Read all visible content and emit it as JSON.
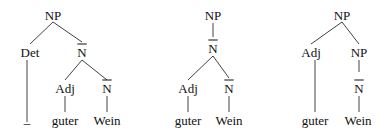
{
  "trees": [
    {
      "nodes": [
        {
          "id": "t1_np",
          "label": "NP",
          "x": 53,
          "y": 15
        },
        {
          "id": "t1_det",
          "label": "Det",
          "x": 30,
          "y": 52
        },
        {
          "id": "t1_nbar1",
          "label": "N",
          "bar": true,
          "x": 82,
          "y": 52
        },
        {
          "id": "t1_adj",
          "label": "Adj",
          "x": 65,
          "y": 88
        },
        {
          "id": "t1_nbar2",
          "label": "N",
          "bar": true,
          "x": 107,
          "y": 88
        },
        {
          "id": "t1_guter",
          "label": "guter",
          "x": 65,
          "y": 120
        },
        {
          "id": "t1_wein",
          "label": "Wein",
          "x": 107,
          "y": 120
        },
        {
          "id": "t1_empty",
          "label": "_",
          "x": 27,
          "y": 118
        }
      ],
      "edges": [
        [
          53,
          22,
          30,
          44
        ],
        [
          53,
          22,
          82,
          42
        ],
        [
          82,
          60,
          65,
          80
        ],
        [
          82,
          60,
          107,
          80
        ],
        [
          27,
          60,
          27,
          122
        ],
        [
          65,
          96,
          65,
          112
        ],
        [
          107,
          96,
          107,
          112
        ]
      ]
    },
    {
      "nodes": [
        {
          "id": "t2_np",
          "label": "NP",
          "x": 213,
          "y": 15
        },
        {
          "id": "t2_nbar1",
          "label": "N",
          "bar": true,
          "x": 213,
          "y": 48
        },
        {
          "id": "t2_adj",
          "label": "Adj",
          "x": 188,
          "y": 88
        },
        {
          "id": "t2_nbar2",
          "label": "N",
          "bar": true,
          "x": 229,
          "y": 88
        },
        {
          "id": "t2_guter",
          "label": "guter",
          "x": 188,
          "y": 120
        },
        {
          "id": "t2_wein",
          "label": "Wein",
          "x": 229,
          "y": 120
        }
      ],
      "edges": [
        [
          213,
          23,
          213,
          37
        ],
        [
          213,
          56,
          188,
          80
        ],
        [
          213,
          56,
          229,
          78
        ],
        [
          188,
          96,
          188,
          112
        ],
        [
          229,
          96,
          229,
          112
        ]
      ]
    },
    {
      "nodes": [
        {
          "id": "t3_np",
          "label": "NP",
          "x": 342,
          "y": 15
        },
        {
          "id": "t3_adj",
          "label": "Adj",
          "x": 311,
          "y": 52
        },
        {
          "id": "t3_np2",
          "label": "NP",
          "x": 359,
          "y": 52
        },
        {
          "id": "t3_nbar",
          "label": "N",
          "bar": true,
          "x": 359,
          "y": 88
        },
        {
          "id": "t3_guter",
          "label": "guter",
          "x": 315,
          "y": 120
        },
        {
          "id": "t3_wein",
          "label": "Wein",
          "x": 358,
          "y": 120
        }
      ],
      "edges": [
        [
          342,
          22,
          311,
          44
        ],
        [
          342,
          22,
          359,
          44
        ],
        [
          315,
          60,
          315,
          112
        ],
        [
          359,
          60,
          359,
          72
        ],
        [
          359,
          96,
          359,
          112
        ]
      ]
    }
  ],
  "colors": {
    "ink": "#111111",
    "background": "#ffffff"
  }
}
